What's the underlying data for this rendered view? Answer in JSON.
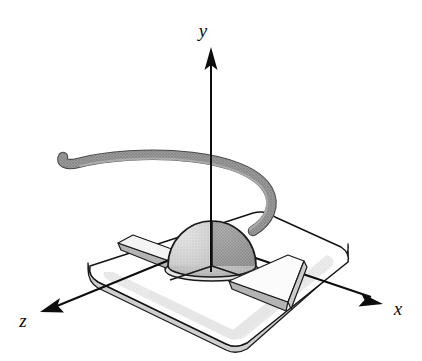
{
  "figure": {
    "name": "hemispherical-transducer-on-base-plate",
    "background_color": "#ffffff",
    "width": 422,
    "height": 361
  },
  "axes": {
    "origin": {
      "x": 211,
      "y": 243
    },
    "stroke_color": "#0d0d0d",
    "stroke_width": 2.0,
    "items": [
      {
        "name": "y",
        "label": "y",
        "label_x": 206,
        "label_y": 36,
        "direction": "up",
        "tip_x": 211,
        "tip_y": 48,
        "tail_x": 211,
        "tail_y": 272
      },
      {
        "name": "x",
        "label": "x",
        "label_x": 396,
        "label_y": 314,
        "direction": "down-right",
        "tip_x": 383,
        "tip_y": 304,
        "tail_x": 211,
        "tail_y": 243
      },
      {
        "name": "z",
        "label": "z",
        "label_x": 18,
        "label_y": 326,
        "direction": "down-left",
        "tip_x": 40,
        "tip_y": 312,
        "tail_x": 211,
        "tail_y": 243
      }
    ]
  },
  "base_plate": {
    "name": "base-plate",
    "description": "rounded-corner square plate shown in perspective",
    "top_face_fill": "#ffffff",
    "side_face_fill": "#d9d9d9",
    "inner_shadow_fill": "#e2e2e2",
    "outline_color": "#141414",
    "outline_width": 1.4,
    "corners": {
      "top": {
        "x": 268,
        "y": 215
      },
      "right": {
        "x": 341,
        "y": 247
      },
      "bottom": {
        "x": 236,
        "y": 344
      },
      "left": {
        "x": 88,
        "y": 263
      }
    },
    "thickness": 13
  },
  "dome": {
    "name": "hemisphere-dome",
    "description": "stippled hemispherical dome at the coordinate origin",
    "center_x": 212,
    "center_y": 268,
    "radius_x": 44,
    "radius_y": 45,
    "rim_ellipse_ry": 10,
    "sector_fills": {
      "upper_left": "#d2d2d2",
      "upper_right": "#9a9a9a",
      "front": "#b9b9b9"
    },
    "outline_color": "#1a1a1a",
    "outline_width": 1.6
  },
  "bars": [
    {
      "name": "bar-left",
      "description": "flat rectangular slab extending toward negative x / behind dome",
      "top_fill": "#f2f2f2",
      "side_fill": "#b4b4b4",
      "outline_color": "#1a1a1a"
    },
    {
      "name": "bar-right",
      "description": "flat rectangular slab extending toward positive x in front of dome",
      "top_fill": "#fafafa",
      "side_fill": "#b4b4b4",
      "outline_color": "#1a1a1a"
    }
  ],
  "cable": {
    "name": "cable",
    "description": "thick curved gray cable emerging from the right side of the dome, arcing up and over to the left with a rounded free end",
    "stroke_color": "#8e8e8e",
    "outline_color": "#4d4d4d",
    "stroke_width": 9,
    "start": {
      "x": 250,
      "y": 228
    },
    "end": {
      "x": 63,
      "y": 159
    }
  }
}
